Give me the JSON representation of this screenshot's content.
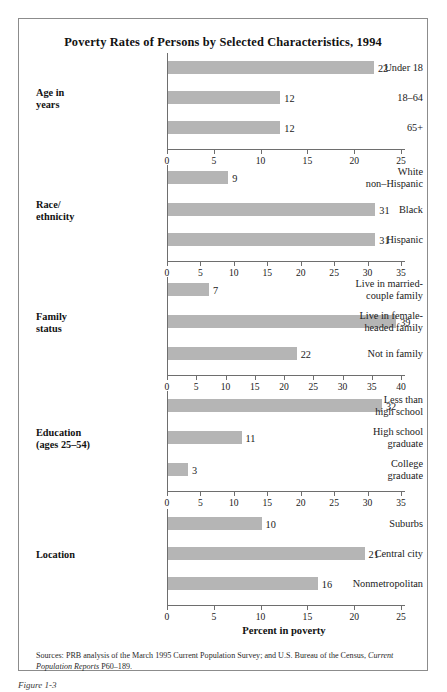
{
  "figure": {
    "title": "Poverty Rates of Persons by Selected Characteristics, 1994",
    "axis_title": "Percent in poverty",
    "caption": "Figure 1-3",
    "source_prefix": "Sources: PRB analysis of the March 1995 Current Population Survey; and U.S. Bureau of the Census, ",
    "source_italic": "Current Population Reports",
    "source_suffix": " P60–189.",
    "bar_color": "#b5b5b5",
    "axis_color": "#6e6e6e",
    "frame_color": "#8c8c8c"
  },
  "chart_data": {
    "type": "bar",
    "orientation": "horizontal",
    "title": "Poverty Rates of Persons by Selected Characteristics, 1994",
    "xlabel": "Percent in poverty",
    "ylabel": "",
    "grid": false,
    "legend": "none",
    "panels": [
      {
        "group": "Age in years",
        "group_lines": [
          "Age in",
          "years"
        ],
        "xlim": [
          0,
          25
        ],
        "xticks": [
          0,
          5,
          10,
          15,
          20,
          25
        ],
        "categories": [
          "Under 18",
          "18–64",
          "65+"
        ],
        "category_lines": [
          [
            "Under 18"
          ],
          [
            "18–64"
          ],
          [
            "65+"
          ]
        ],
        "values": [
          22,
          12,
          12
        ]
      },
      {
        "group": "Race/ ethnicity",
        "group_lines": [
          "Race/",
          "ethnicity"
        ],
        "xlim": [
          0,
          35
        ],
        "xticks": [
          0,
          5,
          10,
          15,
          20,
          25,
          30,
          35
        ],
        "categories": [
          "White non-Hispanic",
          "Black",
          "Hispanic"
        ],
        "category_lines": [
          [
            "White",
            "non–Hispanic"
          ],
          [
            "Black"
          ],
          [
            "Hispanic"
          ]
        ],
        "values": [
          9,
          31,
          31
        ]
      },
      {
        "group": "Family status",
        "group_lines": [
          "Family",
          "status"
        ],
        "xlim": [
          0,
          40
        ],
        "xticks": [
          0,
          5,
          10,
          15,
          20,
          25,
          30,
          35,
          40
        ],
        "categories": [
          "Live in married-couple family",
          "Live in female-headed family",
          "Not in family"
        ],
        "category_lines": [
          [
            "Live in married-",
            "couple family"
          ],
          [
            "Live in female-",
            "headed family"
          ],
          [
            "Not in family"
          ]
        ],
        "values": [
          7,
          39,
          22
        ]
      },
      {
        "group": "Education (ages 25–54)",
        "group_lines": [
          "Education",
          "(ages 25–54)"
        ],
        "xlim": [
          0,
          35
        ],
        "xticks": [
          0,
          5,
          10,
          15,
          20,
          25,
          30,
          35
        ],
        "categories": [
          "Less than high school",
          "High school graduate",
          "College graduate"
        ],
        "category_lines": [
          [
            "Less than",
            "high school"
          ],
          [
            "High school",
            "graduate"
          ],
          [
            "College",
            "graduate"
          ]
        ],
        "values": [
          32,
          11,
          3
        ]
      },
      {
        "group": "Location",
        "group_lines": [
          "Location"
        ],
        "xlim": [
          0,
          25
        ],
        "xticks": [
          0,
          5,
          10,
          15,
          20,
          25
        ],
        "categories": [
          "Suburbs",
          "Central city",
          "Nonmetropolitan"
        ],
        "category_lines": [
          [
            "Suburbs"
          ],
          [
            "Central city"
          ],
          [
            "Nonmetropolitan"
          ]
        ],
        "values": [
          10,
          21,
          16
        ]
      }
    ]
  }
}
